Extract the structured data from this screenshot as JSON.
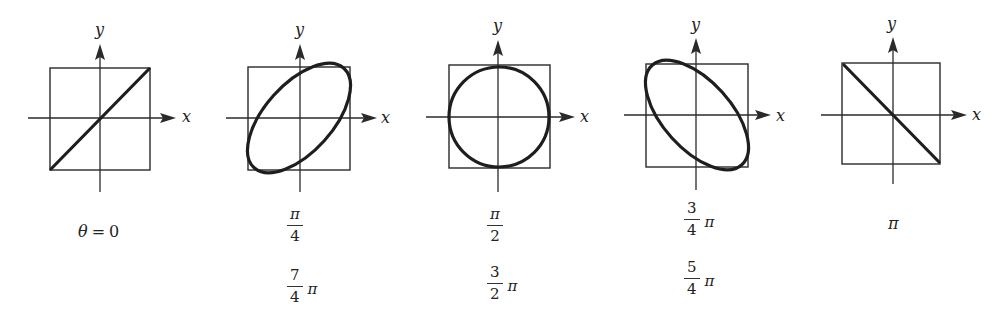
{
  "figure": {
    "axis_labels": {
      "x": "x",
      "y": "y"
    },
    "ink_color": "#222222",
    "panels": [
      {
        "id": "p0",
        "shape": "line-increasing",
        "phase_fraction_of_pi": 0,
        "labels": [
          {
            "text": "θ = 0",
            "theta": "θ",
            "eq": "=",
            "value": "0"
          }
        ]
      },
      {
        "id": "p1",
        "shape": "ellipse-tilted-right",
        "phase_fraction_of_pi": 0.25,
        "labels": [
          {
            "num": "π",
            "den": "4",
            "suffix": ""
          },
          {
            "num": "7",
            "den": "4",
            "suffix": "π"
          }
        ]
      },
      {
        "id": "p2",
        "shape": "circle",
        "phase_fraction_of_pi": 0.5,
        "labels": [
          {
            "num": "π",
            "den": "2",
            "suffix": ""
          },
          {
            "num": "3",
            "den": "2",
            "suffix": "π"
          }
        ]
      },
      {
        "id": "p3",
        "shape": "ellipse-tilted-left",
        "phase_fraction_of_pi": 0.75,
        "labels": [
          {
            "num": "3",
            "den": "4",
            "suffix": "π"
          },
          {
            "num": "5",
            "den": "4",
            "suffix": "π"
          }
        ]
      },
      {
        "id": "p4",
        "shape": "line-decreasing",
        "phase_fraction_of_pi": 1,
        "labels": [
          {
            "text": "π"
          }
        ]
      }
    ]
  }
}
